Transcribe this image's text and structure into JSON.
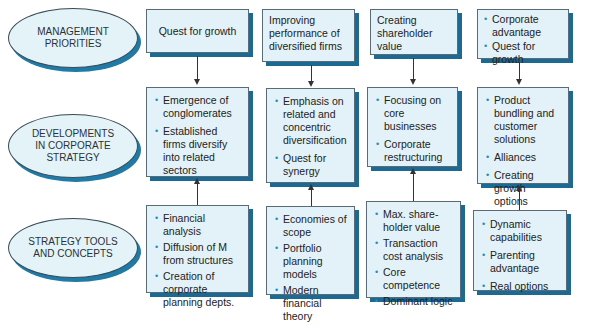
{
  "rows": {
    "management": {
      "lines": [
        "MANAGEMENT",
        "PRIORITIES"
      ]
    },
    "developments": {
      "lines": [
        "DEVELOPMENTS",
        "IN CORPORATE",
        "STRATEGY"
      ]
    },
    "tools": {
      "lines": [
        "STRATEGY TOOLS",
        "AND CONCEPTS"
      ]
    }
  },
  "columns": [
    {
      "priority": {
        "text": "Quest for growth"
      },
      "developments": [
        "Emergence of conglomerates",
        "Established firms diversify into related sectors"
      ],
      "tools": [
        "Financial analysis",
        "Diffusion of M from structures",
        "Creation of corporate planning depts."
      ]
    },
    {
      "priority": {
        "text": "Improving performance of diversified firms"
      },
      "developments": [
        "Emphasis on related and concentric diversification",
        "Quest for synergy"
      ],
      "tools": [
        "Economies of scope",
        "Portfolio planning models",
        "Modern financial theory"
      ]
    },
    {
      "priority": {
        "text": "Creating shareholder value"
      },
      "developments": [
        "Focusing on core businesses",
        "Corporate restructuring"
      ],
      "tools": [
        "Max. share-holder value",
        "Transaction cost analysis",
        "Core competence",
        "Dominant logic"
      ]
    },
    {
      "priority": {
        "bullets": [
          "Corporate advantage",
          "Quest for growth"
        ]
      },
      "developments": [
        "Product bundling and customer solutions",
        "Alliances",
        "Creating growth options"
      ],
      "tools": [
        "Dynamic capabilities",
        "Parenting advantage",
        "Real options"
      ]
    }
  ],
  "colors": {
    "box_fill": "#e3f2f8",
    "shadow": "#1a6a93",
    "bullet": "#1d8fc0"
  }
}
